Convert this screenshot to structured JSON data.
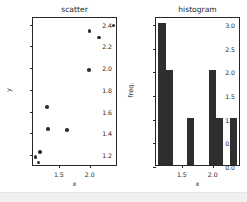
{
  "figure": {
    "background_color": "#ffffff",
    "foreground_color": "#262626",
    "marker_color": "#2f2f2f",
    "bar_color": "#2e2e2e"
  },
  "chart_data": [
    {
      "type": "scatter",
      "title": "scatter",
      "xlabel": "x",
      "ylabel": "y",
      "xlim": [
        1.08,
        2.46
      ],
      "ylim": [
        1.09,
        2.46
      ],
      "xticks": [
        1.5,
        2.0
      ],
      "xticklabels": [
        "1.5",
        "2.0"
      ],
      "yticks": [
        1.2,
        1.4,
        1.6,
        1.8,
        2.0,
        2.2,
        2.4
      ],
      "yticklabels": [
        "1.2",
        "1.4",
        "1.6",
        "1.8",
        "2.0",
        "2.2",
        "2.4"
      ],
      "grid": false,
      "legend": null,
      "x": [
        1.12,
        1.17,
        1.19,
        1.31,
        1.32,
        1.63,
        1.99,
        2.0,
        2.15,
        2.39
      ],
      "y": [
        1.18,
        1.13,
        1.23,
        1.64,
        1.44,
        1.43,
        1.98,
        2.34,
        2.28,
        2.39
      ],
      "points": [
        {
          "x": 1.12,
          "y": 1.18
        },
        {
          "x": 1.17,
          "y": 1.13
        },
        {
          "x": 1.19,
          "y": 1.23
        },
        {
          "x": 1.31,
          "y": 1.64
        },
        {
          "x": 1.32,
          "y": 1.44
        },
        {
          "x": 1.63,
          "y": 1.43
        },
        {
          "x": 1.99,
          "y": 1.98
        },
        {
          "x": 2.0,
          "y": 2.34
        },
        {
          "x": 2.15,
          "y": 2.28
        },
        {
          "x": 2.39,
          "y": 2.39
        }
      ]
    },
    {
      "type": "bar",
      "title": "histogram",
      "xlabel": "x",
      "ylabel": "freq.",
      "xlim": [
        1.08,
        2.46
      ],
      "ylim": [
        0.0,
        3.15
      ],
      "xticks": [
        1.5,
        2.0
      ],
      "xticklabels": [
        "1.5",
        "2.0"
      ],
      "yticks": [
        0.0,
        0.5,
        1.0,
        1.5,
        2.0,
        2.5,
        3.0
      ],
      "yticklabels": [
        "0.0",
        "0.5",
        "1.0",
        "1.5",
        "2.0",
        "2.5",
        "3.0"
      ],
      "grid": false,
      "legend": null,
      "bin_edges": [
        1.12,
        1.24,
        1.35,
        1.47,
        1.59,
        1.7,
        1.82,
        1.94,
        2.05,
        2.17,
        2.28,
        2.4
      ],
      "bars": [
        {
          "left": 1.12,
          "right": 1.24,
          "value": 3
        },
        {
          "left": 1.24,
          "right": 1.35,
          "value": 2
        },
        {
          "left": 1.59,
          "right": 1.7,
          "value": 1
        },
        {
          "left": 1.94,
          "right": 2.05,
          "value": 2
        },
        {
          "left": 2.05,
          "right": 2.17,
          "value": 1
        },
        {
          "left": 2.28,
          "right": 2.4,
          "value": 1
        }
      ],
      "values": [
        3,
        2,
        0,
        0,
        1,
        0,
        0,
        2,
        1,
        0,
        1
      ]
    }
  ]
}
